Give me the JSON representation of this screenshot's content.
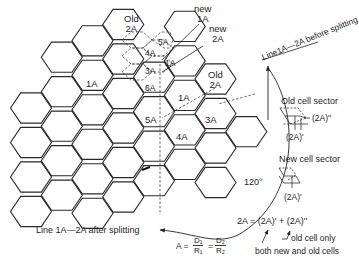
{
  "diagram": {
    "cell_labels": {
      "old_2a_top": [
        "Old",
        "2A"
      ],
      "new_1a": [
        "new",
        "1A"
      ],
      "new_2a": [
        "new",
        "2A"
      ],
      "small_4a": "4A",
      "small_5a": "5A",
      "small_3a": "3A",
      "small_6a": "6A",
      "small_1a": "1A",
      "big_1a_left": "1A",
      "old_2a_right": [
        "Old",
        "2A"
      ],
      "big_1a_center": "1A",
      "big_5a": "5A",
      "big_3a": "3A",
      "big_4a": "4A"
    },
    "line_before": "Line1A—2A before splitting",
    "line_after": "Line 1A—2A after splitting",
    "angle": "120°",
    "old_sector": {
      "title": "Old cell sector",
      "label_double_prime": "(2A)''",
      "label_prime": "(2A)'"
    },
    "new_sector": {
      "title": "New cell sector",
      "label_prime": "(2A)'"
    },
    "equation": "2A = (2A)' + (2A)''",
    "note_old_only": "old cell only",
    "note_both": "both new and old cells",
    "formula": {
      "lhs": "A =",
      "f1_num": "D₁",
      "f1_den": "R₁",
      "eq": "=",
      "f2_num": "D₂",
      "f2_den": "R₂"
    },
    "colors": {
      "line": "#2a2a2a",
      "dashed": "#444444",
      "background": "#ffffff"
    }
  }
}
